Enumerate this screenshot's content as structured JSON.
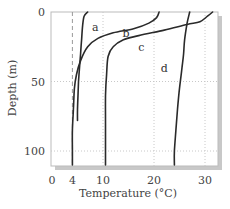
{
  "chart_data": {
    "type": "line",
    "title": "",
    "xlabel": "Temperature (°C)",
    "ylabel": "Depth (m)",
    "xlim": [
      0,
      32
    ],
    "ylim": [
      110,
      0
    ],
    "y_inverted": true,
    "x_ticks": [
      0,
      4,
      10,
      20,
      30
    ],
    "x_tick_labels": [
      "0",
      "4",
      "10",
      "20",
      "30"
    ],
    "y_ticks": [
      0,
      50,
      100
    ],
    "y_tick_labels": [
      "0",
      "50",
      "100"
    ],
    "grid": {
      "x": [
        10,
        20,
        30
      ],
      "y": [
        50,
        100
      ],
      "style": "dotted"
    },
    "reference_line": {
      "x": 4,
      "style": "dashed",
      "label": "4"
    },
    "series": [
      {
        "name": "a",
        "points": [
          [
            7.0,
            0
          ],
          [
            6.3,
            3
          ],
          [
            6.0,
            10
          ],
          [
            5.8,
            20
          ],
          [
            5.6,
            30
          ],
          [
            5.4,
            40
          ],
          [
            5.2,
            50
          ],
          [
            5.1,
            60
          ],
          [
            5.0,
            70
          ],
          [
            5.0,
            78
          ]
        ]
      },
      {
        "name": "b",
        "points": [
          [
            21.0,
            0
          ],
          [
            20.5,
            4
          ],
          [
            19.0,
            8
          ],
          [
            16.0,
            12
          ],
          [
            12.0,
            15
          ],
          [
            9.0,
            19
          ],
          [
            7.0,
            25
          ],
          [
            5.6,
            35
          ],
          [
            4.8,
            45
          ],
          [
            4.4,
            55
          ],
          [
            4.2,
            70
          ],
          [
            4.0,
            85
          ],
          [
            4.0,
            100
          ],
          [
            4.0,
            110
          ]
        ]
      },
      {
        "name": "c",
        "points": [
          [
            31.5,
            0
          ],
          [
            30.5,
            3
          ],
          [
            29.0,
            7
          ],
          [
            26.5,
            9
          ],
          [
            22.0,
            13
          ],
          [
            17.0,
            17
          ],
          [
            14.0,
            20
          ],
          [
            12.0,
            25
          ],
          [
            11.0,
            32
          ],
          [
            10.7,
            45
          ],
          [
            10.5,
            60
          ],
          [
            10.5,
            80
          ],
          [
            10.5,
            100
          ],
          [
            10.5,
            110
          ]
        ]
      },
      {
        "name": "d",
        "points": [
          [
            27.0,
            0
          ],
          [
            26.5,
            8
          ],
          [
            26.0,
            20
          ],
          [
            25.8,
            30
          ],
          [
            25.5,
            40
          ],
          [
            25.0,
            55
          ],
          [
            24.6,
            70
          ],
          [
            24.3,
            85
          ],
          [
            24.0,
            100
          ],
          [
            24.0,
            110
          ]
        ]
      }
    ],
    "labels": [
      {
        "text": "a",
        "x": 8.5,
        "y": 11
      },
      {
        "text": "b",
        "x": 14.5,
        "y": 15
      },
      {
        "text": "c",
        "x": 17.5,
        "y": 25
      },
      {
        "text": "d",
        "x": 22.0,
        "y": 40
      }
    ],
    "colors": {
      "line": "#2a2a2a",
      "frame": "#bbbbbb",
      "shadow": "#c8c8c8",
      "grid": "#c8c8c8",
      "dashed": "#9a9a9a"
    }
  }
}
